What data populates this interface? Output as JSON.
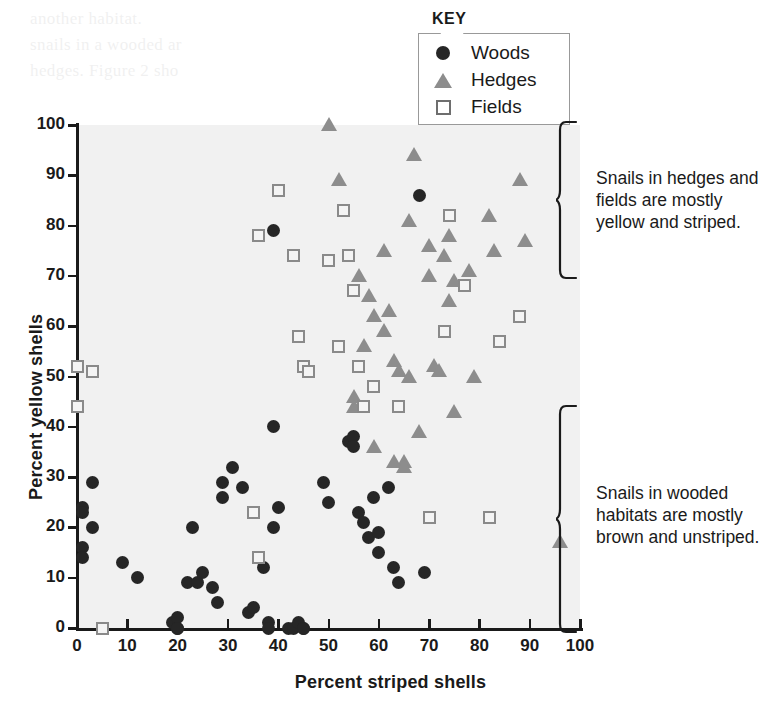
{
  "chart_data": {
    "type": "scatter",
    "title": "",
    "xlabel": "Percent striped shells",
    "ylabel": "Percent yellow shells",
    "xlim": [
      0,
      100
    ],
    "ylim": [
      0,
      100
    ],
    "xticks": [
      0,
      10,
      20,
      30,
      40,
      50,
      60,
      70,
      80,
      90,
      100
    ],
    "yticks": [
      0,
      10,
      20,
      30,
      40,
      50,
      60,
      70,
      80,
      90,
      100
    ],
    "grid": false,
    "legend_position": "top-center",
    "series": [
      {
        "name": "Woods",
        "marker": "circle",
        "color": "#262626",
        "points": [
          [
            1,
            24
          ],
          [
            1,
            23
          ],
          [
            1,
            16
          ],
          [
            1,
            14
          ],
          [
            3,
            29
          ],
          [
            3,
            20
          ],
          [
            9,
            13
          ],
          [
            12,
            10
          ],
          [
            19,
            1
          ],
          [
            20,
            2
          ],
          [
            20,
            0
          ],
          [
            20,
            0
          ],
          [
            22,
            9
          ],
          [
            23,
            20
          ],
          [
            24,
            9
          ],
          [
            25,
            11
          ],
          [
            27,
            8
          ],
          [
            28,
            5
          ],
          [
            29,
            26
          ],
          [
            29,
            29
          ],
          [
            31,
            32
          ],
          [
            33,
            28
          ],
          [
            34,
            3
          ],
          [
            35,
            4
          ],
          [
            37,
            12
          ],
          [
            38,
            1
          ],
          [
            38,
            0
          ],
          [
            39,
            79
          ],
          [
            39,
            40
          ],
          [
            39,
            20
          ],
          [
            40,
            24
          ],
          [
            42,
            0
          ],
          [
            43,
            0
          ],
          [
            44,
            1
          ],
          [
            45,
            0
          ],
          [
            45,
            0
          ],
          [
            49,
            29
          ],
          [
            50,
            25
          ],
          [
            54,
            37
          ],
          [
            55,
            38
          ],
          [
            55,
            36
          ],
          [
            56,
            23
          ],
          [
            57,
            21
          ],
          [
            58,
            18
          ],
          [
            59,
            26
          ],
          [
            60,
            19
          ],
          [
            60,
            15
          ],
          [
            62,
            28
          ],
          [
            63,
            12
          ],
          [
            64,
            9
          ],
          [
            68,
            86
          ],
          [
            69,
            11
          ]
        ]
      },
      {
        "name": "Hedges",
        "marker": "triangle",
        "color": "#8d8d8d",
        "points": [
          [
            50,
            100
          ],
          [
            52,
            89
          ],
          [
            55,
            46
          ],
          [
            55,
            44
          ],
          [
            56,
            70
          ],
          [
            57,
            56
          ],
          [
            58,
            66
          ],
          [
            59,
            62
          ],
          [
            59,
            36
          ],
          [
            61,
            75
          ],
          [
            61,
            59
          ],
          [
            62,
            63
          ],
          [
            63,
            53
          ],
          [
            63,
            33
          ],
          [
            64,
            51
          ],
          [
            65,
            33
          ],
          [
            65,
            32
          ],
          [
            66,
            81
          ],
          [
            66,
            50
          ],
          [
            67,
            94
          ],
          [
            68,
            39
          ],
          [
            70,
            76
          ],
          [
            70,
            70
          ],
          [
            71,
            52
          ],
          [
            72,
            51
          ],
          [
            73,
            74
          ],
          [
            74,
            78
          ],
          [
            74,
            65
          ],
          [
            75,
            69
          ],
          [
            75,
            43
          ],
          [
            78,
            71
          ],
          [
            79,
            50
          ],
          [
            82,
            82
          ],
          [
            83,
            75
          ],
          [
            88,
            89
          ],
          [
            89,
            77
          ],
          [
            96,
            17
          ]
        ]
      },
      {
        "name": "Fields",
        "marker": "square",
        "color": "#8a8a8a",
        "points": [
          [
            0,
            52
          ],
          [
            0,
            44
          ],
          [
            3,
            51
          ],
          [
            5,
            0
          ],
          [
            36,
            78
          ],
          [
            40,
            87
          ],
          [
            43,
            74
          ],
          [
            44,
            58
          ],
          [
            35,
            23
          ],
          [
            36,
            14
          ],
          [
            45,
            52
          ],
          [
            46,
            51
          ],
          [
            50,
            73
          ],
          [
            52,
            56
          ],
          [
            53,
            83
          ],
          [
            54,
            74
          ],
          [
            55,
            67
          ],
          [
            56,
            52
          ],
          [
            57,
            44
          ],
          [
            59,
            48
          ],
          [
            64,
            44
          ],
          [
            70,
            22
          ],
          [
            73,
            59
          ],
          [
            74,
            82
          ],
          [
            77,
            68
          ],
          [
            82,
            22
          ],
          [
            84,
            57
          ],
          [
            88,
            62
          ]
        ]
      }
    ],
    "annotations": [
      {
        "id": "upper",
        "text": "Snails in hedges and\nfields are mostly\nyellow and striped.",
        "bracket_from_y": 100,
        "bracket_to_y": 58
      },
      {
        "id": "lower",
        "text": "Snails in wooded\nhabitats are mostly\nbrown and unstriped.",
        "bracket_from_y": 57,
        "bracket_to_y": 0
      }
    ]
  },
  "legend": {
    "title": "KEY",
    "items": [
      {
        "label": "Woods",
        "marker": "circle-icon"
      },
      {
        "label": "Hedges",
        "marker": "triangle-icon"
      },
      {
        "label": "Fields",
        "marker": "square-icon"
      }
    ]
  },
  "colors": {
    "woods": "#262626",
    "hedges": "#8d8d8d",
    "fields": "#8a8a8a",
    "plot_background": "#f1f1f1",
    "axis": "#1a1a1a"
  },
  "bleed_text": {
    "l1": "another habitat.",
    "l2": "snails in a wooded ar",
    "l3": "hedges. Figure 2 sho",
    "l4": "to the same snail marking. Their Upper",
    "l5": "provide the camouflage they need to survi",
    "l6": "in woods than in hedges or fields. Populatio",
    "l7": "snails have also spread within the",
    "l8": "Hedges and fields provide other surfaces",
    "l9": "more prey to be seen, especially under field",
    "l10": "and they account for more the inhabitants"
  }
}
